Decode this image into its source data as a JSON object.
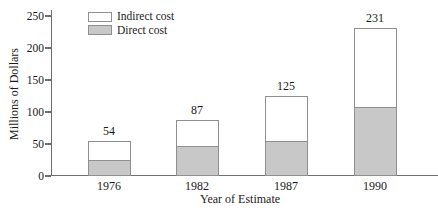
{
  "chart_data": {
    "type": "bar",
    "subtype": "stacked",
    "title": "",
    "xlabel": "Year of Estimate",
    "ylabel": "Millions of Dollars",
    "categories": [
      "1976",
      "1982",
      "1987",
      "1990"
    ],
    "series": [
      {
        "name": "Direct cost",
        "values": [
          24,
          45,
          53,
          106
        ],
        "color": "#c8c8c8"
      },
      {
        "name": "Indirect cost",
        "values": [
          30,
          42,
          72,
          125
        ],
        "color": "#ffffff"
      }
    ],
    "totals": [
      54,
      87,
      125,
      231
    ],
    "total_labels": [
      "54",
      "87",
      "125",
      "231"
    ],
    "ylim": [
      0,
      250
    ],
    "yticks": [
      0,
      50,
      100,
      150,
      200,
      250
    ],
    "grid": false,
    "legend_position": "top-left-inside",
    "colors": {
      "bar_fill_gray": "#c8c8c8",
      "bar_fill_white": "#ffffff",
      "bar_border": "#8f8f8f",
      "axis": "#6f6f6f",
      "text": "#1a1a1a",
      "background": "#ffffff"
    }
  }
}
